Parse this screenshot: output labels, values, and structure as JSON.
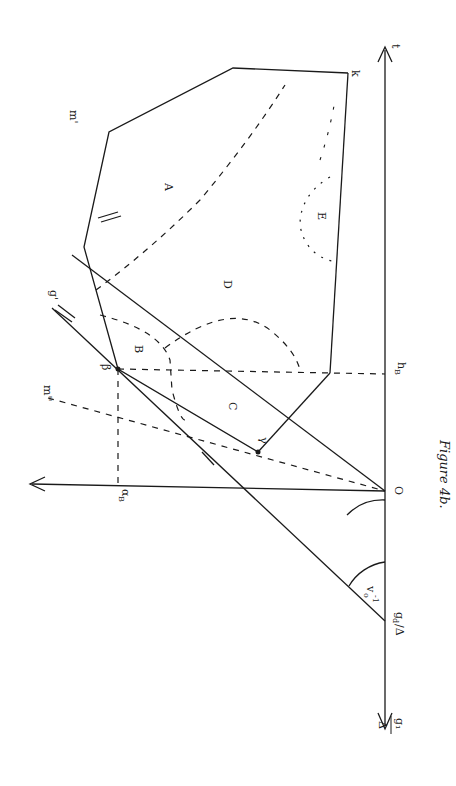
{
  "figure": {
    "caption": "Figure 4b.",
    "orientation": "rotated 90° counter-clockwise",
    "axes": {
      "vertical_top_label": "t",
      "vertical_bottom_label_num": "g₁",
      "vertical_bottom_label_den": "Δ",
      "horizontal_label": "α",
      "horizontal_label_sub": "B",
      "origin_label": "O"
    },
    "points": {
      "beta": "β",
      "gamma": "γ",
      "k": "k",
      "h_B": "h",
      "h_B_sub": "B",
      "g_d": "g",
      "g_d_sub": "d",
      "g_d_suffix": "/Δ"
    },
    "lines": {
      "g_prime": "g'",
      "m_prime": "m'",
      "m_double_prime": "m''"
    },
    "regions": [
      "A",
      "B",
      "C",
      "D",
      "E"
    ],
    "angle_label": "v",
    "angle_label_sub": "o",
    "angle_label_sup": "-1"
  }
}
